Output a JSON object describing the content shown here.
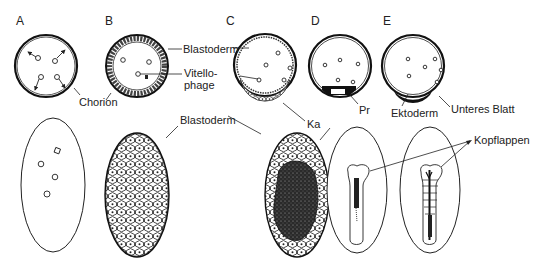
{
  "figure": {
    "panels": [
      {
        "id": "A",
        "letter": "A"
      },
      {
        "id": "B",
        "letter": "B"
      },
      {
        "id": "C",
        "letter": "C"
      },
      {
        "id": "D",
        "letter": "D"
      },
      {
        "id": "E",
        "letter": "E"
      }
    ],
    "labels": {
      "chorion": "Chorion",
      "blastoderm_top": "Blastoderm",
      "vitellophage_1": "Vitello-",
      "vitellophage_2": "phage",
      "blastoderm_bottom": "Blastoderm",
      "ka": "Ka",
      "pr": "Pr",
      "ektoderm": "Ektoderm",
      "unteres_blatt": "Unteres Blatt",
      "kopflappen": "Kopflappen"
    },
    "colors": {
      "ink": "#1a1a1a",
      "background": "#ffffff",
      "shade": "#3a3a3a"
    }
  }
}
